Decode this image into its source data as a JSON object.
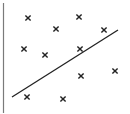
{
  "chart_data": {
    "type": "scatter",
    "title": "",
    "xlabel": "",
    "ylabel": "",
    "grid": false,
    "axes": {
      "y_axis_visible": true,
      "x_axis_visible": false
    },
    "points_px": [
      {
        "x": 28,
        "y": 18
      },
      {
        "x": 79,
        "y": 17
      },
      {
        "x": 56,
        "y": 29
      },
      {
        "x": 104,
        "y": 30
      },
      {
        "x": 24,
        "y": 49
      },
      {
        "x": 45,
        "y": 55
      },
      {
        "x": 80,
        "y": 49
      },
      {
        "x": 81,
        "y": 76
      },
      {
        "x": 115,
        "y": 71
      },
      {
        "x": 27,
        "y": 97
      },
      {
        "x": 63,
        "y": 99
      }
    ],
    "fit_line_px": {
      "x1": 12,
      "y1": 97,
      "x2": 118,
      "y2": 30
    },
    "marker": "x",
    "marker_color": "#222222",
    "line_color": "#222222",
    "axis_color": "#7a7a7a"
  }
}
